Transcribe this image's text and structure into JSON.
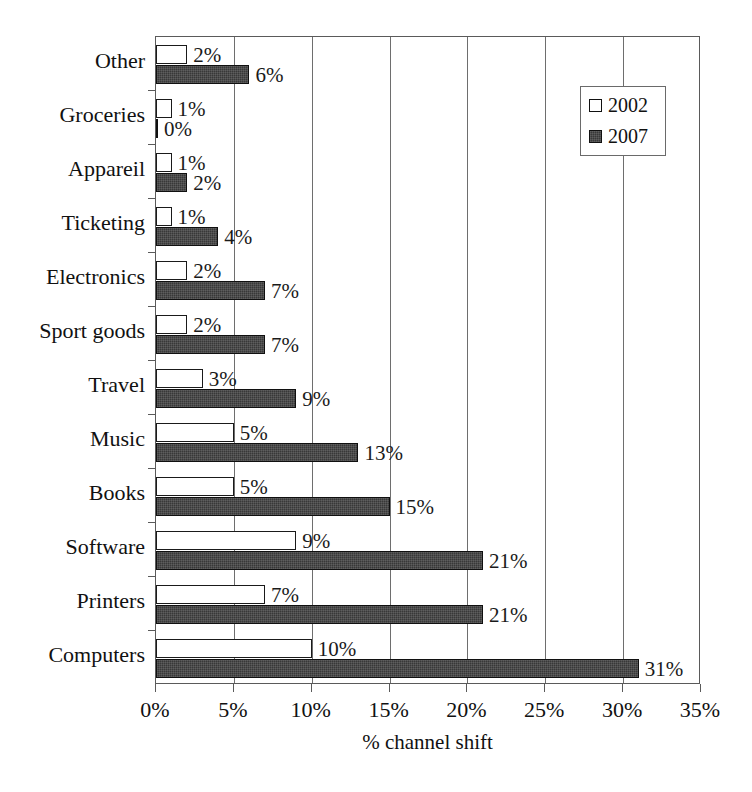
{
  "chart_data": {
    "type": "bar",
    "orientation": "horizontal",
    "title": "",
    "xlabel": "% channel shift",
    "ylabel": "",
    "xlim": [
      0,
      35
    ],
    "xtick_labels": [
      "0%",
      "5%",
      "10%",
      "15%",
      "20%",
      "25%",
      "30%",
      "35%"
    ],
    "xtick_values": [
      0,
      5,
      10,
      15,
      20,
      25,
      30,
      35
    ],
    "grid": true,
    "grid_axis": "x",
    "legend_position": "top-right-inside",
    "categories": [
      "Other",
      "Groceries",
      "Appareil",
      "Ticketing",
      "Electronics",
      "Sport goods",
      "Travel",
      "Music",
      "Books",
      "Software",
      "Printers",
      "Computers"
    ],
    "series": [
      {
        "name": "2002",
        "color": "#ffffff",
        "values": [
          2,
          1,
          1,
          1,
          2,
          2,
          3,
          5,
          5,
          9,
          7,
          10
        ],
        "labels": [
          "2%",
          "1%",
          "1%",
          "1%",
          "2%",
          "2%",
          "3%",
          "5%",
          "5%",
          "9%",
          "7%",
          "10%"
        ]
      },
      {
        "name": "2007",
        "color": "#383838",
        "values": [
          6,
          0,
          2,
          4,
          7,
          7,
          9,
          13,
          15,
          21,
          21,
          31
        ],
        "labels": [
          "6%",
          "0%",
          "2%",
          "4%",
          "7%",
          "7%",
          "9%",
          "13%",
          "15%",
          "21%",
          "21%",
          "31%"
        ]
      }
    ]
  },
  "legend": {
    "items": [
      {
        "label": "2002",
        "swatch": "open-square-icon"
      },
      {
        "label": "2007",
        "swatch": "filled-square-icon"
      }
    ]
  },
  "axis": {
    "x_title": "% channel shift"
  }
}
